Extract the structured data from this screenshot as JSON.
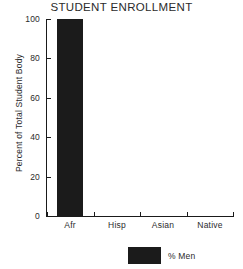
{
  "chart_data": {
    "type": "bar",
    "title": "STUDENT ENROLLMENT",
    "xlabel": "",
    "ylabel": "Percent of Total Student Body",
    "categories": [
      "Afr",
      "Hisp",
      "Asian",
      "Native"
    ],
    "series": [
      {
        "name": "% Men",
        "color": "#1b1b1b",
        "values": [
          100,
          0,
          0,
          0
        ]
      }
    ],
    "ylim": [
      0,
      100
    ],
    "yticks": [
      0,
      20,
      40,
      60,
      80,
      100
    ],
    "ytick_labels": [
      "0",
      "20",
      "40",
      "60",
      "80",
      "100"
    ],
    "grid": false,
    "legend_position": "bottom-center",
    "background_color": "#ffffff",
    "axis_color": "#1a1a1a"
  },
  "legend": {
    "entries": [
      {
        "label": "% Men",
        "color": "#1b1b1b"
      }
    ]
  }
}
